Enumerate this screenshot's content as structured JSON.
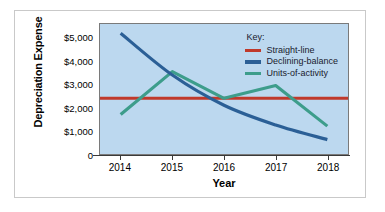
{
  "chart_data": {
    "type": "line",
    "title": "",
    "xlabel": "Year",
    "ylabel": "Depreciation Expense",
    "categories": [
      "2014",
      "2015",
      "2016",
      "2017",
      "2018"
    ],
    "x": [
      2014,
      2015,
      2016,
      2017,
      2018
    ],
    "xlim": [
      2013.6,
      2018.4
    ],
    "ylim": [
      0,
      5600
    ],
    "yticks": [
      0,
      1000,
      2000,
      3000,
      4000,
      5000
    ],
    "ytick_labels": [
      "0",
      "$1,000",
      "$2,000",
      "$3,000",
      "$4,000",
      "$5,000"
    ],
    "grid": false,
    "legend_position": "top-right",
    "legend_title": "Key:",
    "plot_background": "#bcd8ef",
    "series": [
      {
        "name": "Straight-line",
        "color": "#c0392b",
        "shape": "flat",
        "values": [
          2400,
          2400,
          2400,
          2400,
          2400
        ]
      },
      {
        "name": "Declining-balance",
        "color": "#2b5f96",
        "shape": "smooth-decay",
        "values": [
          5200,
          3400,
          2100,
          1250,
          620
        ]
      },
      {
        "name": "Units-of-activity",
        "color": "#3d9d8b",
        "shape": "zigzag",
        "values": [
          1700,
          3550,
          2400,
          2950,
          1200
        ]
      }
    ]
  },
  "figure": {
    "border_color": "#c9c9c9",
    "page_background": "#ffffff"
  }
}
